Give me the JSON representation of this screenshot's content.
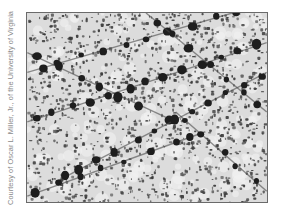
{
  "figure": {
    "credit": "Courtesy of Oscar L. Miller, Jr., of the University of Virginia",
    "image": {
      "subject": "electron-micrograph",
      "description": "Grayscale micrograph showing dark bead-like particles strung along diagonal fibers over a speckled background",
      "colors": {
        "background": "#dcdcdc",
        "speckle": "#3a3a3a",
        "bead": "#1e1e1e",
        "border": "#6a6a6a"
      },
      "strands": [
        {
          "from": [
            0,
            60
          ],
          "to": [
            242,
            -10
          ],
          "beads": 11
        },
        {
          "from": [
            0,
            110
          ],
          "to": [
            242,
            30
          ],
          "beads": 13
        },
        {
          "from": [
            0,
            40
          ],
          "to": [
            150,
            110
          ],
          "beads": 7
        },
        {
          "from": [
            30,
            170
          ],
          "to": [
            242,
            60
          ],
          "beads": 12
        },
        {
          "from": [
            0,
            185
          ],
          "to": [
            180,
            120
          ],
          "beads": 8
        },
        {
          "from": [
            120,
            0
          ],
          "to": [
            242,
            100
          ],
          "beads": 7
        },
        {
          "from": [
            150,
            100
          ],
          "to": [
            242,
            180
          ],
          "beads": 5
        }
      ]
    }
  }
}
